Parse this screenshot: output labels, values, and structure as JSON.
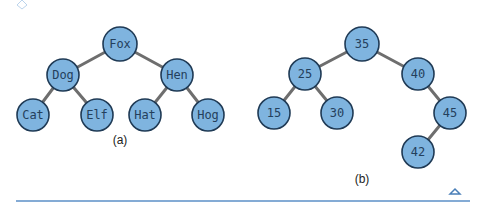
{
  "diagrams": [
    {
      "id": "a",
      "caption": "(a)",
      "nodes": [
        {
          "id": "fox",
          "label": "Fox"
        },
        {
          "id": "dog",
          "label": "Dog"
        },
        {
          "id": "hen",
          "label": "Hen"
        },
        {
          "id": "cat",
          "label": "Cat"
        },
        {
          "id": "elf",
          "label": "Elf"
        },
        {
          "id": "hat",
          "label": "Hat"
        },
        {
          "id": "hog",
          "label": "Hog"
        }
      ],
      "edges": [
        [
          "fox",
          "dog"
        ],
        [
          "fox",
          "hen"
        ],
        [
          "dog",
          "cat"
        ],
        [
          "dog",
          "elf"
        ],
        [
          "hen",
          "hat"
        ],
        [
          "hen",
          "hog"
        ]
      ]
    },
    {
      "id": "b",
      "caption": "(b)",
      "nodes": [
        {
          "id": "n35",
          "label": "35"
        },
        {
          "id": "n25",
          "label": "25"
        },
        {
          "id": "n40",
          "label": "40"
        },
        {
          "id": "n15",
          "label": "15"
        },
        {
          "id": "n30",
          "label": "30"
        },
        {
          "id": "n45",
          "label": "45"
        },
        {
          "id": "n42",
          "label": "42"
        }
      ],
      "edges": [
        [
          "n35",
          "n25"
        ],
        [
          "n35",
          "n40"
        ],
        [
          "n25",
          "n15"
        ],
        [
          "n25",
          "n30"
        ],
        [
          "n40",
          "n45"
        ],
        [
          "n45",
          "n42"
        ]
      ]
    }
  ],
  "colors": {
    "node_fill": "#7fb4df",
    "node_stroke": "#1f3a55",
    "edge": "#6e6e6e",
    "rule": "#5b8fc7"
  }
}
